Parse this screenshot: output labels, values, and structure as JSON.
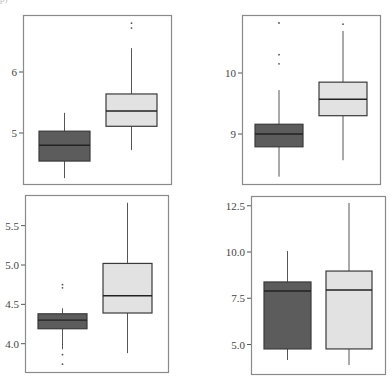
{
  "corner_label": "p) ",
  "colors": {
    "dark_fill": "#5c5c5c",
    "light_fill": "#e2e2e2",
    "box_stroke": "#3a3a3a",
    "median": "#222222",
    "frame": "#8a8a8a",
    "whisker": "#555555"
  },
  "chart_data": [
    {
      "type": "box",
      "panel": "top-left",
      "title": "",
      "xlabel": "",
      "ylabel": "",
      "yticks": [
        5,
        6
      ],
      "ytick_labels": [
        "5",
        "6"
      ],
      "ylim": [
        4.2,
        6.9
      ],
      "series": [
        {
          "name": "group 1 (dark)",
          "q1": 4.54,
          "median": 4.8,
          "q3": 5.03,
          "whisker_low": 4.26,
          "whisker_high": 5.33,
          "outliers": []
        },
        {
          "name": "group 2 (light)",
          "q1": 5.11,
          "median": 5.36,
          "q3": 5.64,
          "whisker_low": 4.72,
          "whisker_high": 6.39,
          "outliers": [
            6.72,
            6.8
          ]
        }
      ],
      "frame": {
        "x": 23,
        "y": 15,
        "w": 148,
        "h": 169
      },
      "px": {
        "ref_y": 133,
        "ref_v": 5,
        "px_per_unit": 61
      },
      "boxes_x": [
        [
          39,
          90
        ],
        [
          106,
          157
        ]
      ]
    },
    {
      "type": "box",
      "panel": "top-right",
      "title": "",
      "xlabel": "",
      "ylabel": "",
      "yticks": [
        9,
        10
      ],
      "ytick_labels": [
        "9",
        "10"
      ],
      "ylim": [
        8.2,
        10.9
      ],
      "series": [
        {
          "name": "group 1 (dark)",
          "q1": 8.79,
          "median": 9.0,
          "q3": 9.16,
          "whisker_low": 8.3,
          "whisker_high": 9.72,
          "outliers": [
            10.15,
            10.3,
            10.82
          ]
        },
        {
          "name": "group 2 (light)",
          "q1": 9.3,
          "median": 9.57,
          "q3": 9.85,
          "whisker_low": 8.57,
          "whisker_high": 10.69,
          "outliers": [
            10.8
          ]
        }
      ],
      "frame": {
        "x": 242,
        "y": 15,
        "w": 138,
        "h": 169
      },
      "px": {
        "ref_y": 134,
        "ref_v": 9,
        "px_per_unit": 61
      },
      "boxes_x": [
        [
          255,
          303
        ],
        [
          319,
          367
        ]
      ]
    },
    {
      "type": "box",
      "panel": "bottom-left",
      "title": "",
      "xlabel": "",
      "ylabel": "",
      "yticks": [
        4.0,
        4.5,
        5.0,
        5.5
      ],
      "ytick_labels": [
        "4.0",
        "4.5",
        "5.0",
        "5.5"
      ],
      "ylim": [
        3.65,
        5.9
      ],
      "series": [
        {
          "name": "group 1 (dark)",
          "q1": 4.19,
          "median": 4.3,
          "q3": 4.38,
          "whisker_low": 3.93,
          "whisker_high": 4.45,
          "outliers": [
            3.74,
            3.86,
            4.71,
            4.75
          ]
        },
        {
          "name": "group 2 (light)",
          "q1": 4.39,
          "median": 4.61,
          "q3": 5.02,
          "whisker_low": 3.88,
          "whisker_high": 5.79,
          "outliers": []
        }
      ],
      "frame": {
        "x": 25,
        "y": 195,
        "w": 143,
        "h": 177
      },
      "px": {
        "ref_y": 265,
        "ref_v": 5.0,
        "px_per_unit": 78.7
      },
      "boxes_x": [
        [
          38,
          87
        ],
        [
          103,
          152
        ]
      ]
    },
    {
      "type": "box",
      "panel": "bottom-right",
      "title": "",
      "xlabel": "",
      "ylabel": "",
      "yticks": [
        5.0,
        7.5,
        10.0,
        12.5
      ],
      "ytick_labels": [
        "5.0",
        "7.5",
        "10.0",
        "12.5"
      ],
      "ylim": [
        3.5,
        13.0
      ],
      "series": [
        {
          "name": "group 1 (dark)",
          "q1": 4.76,
          "median": 7.89,
          "q3": 8.38,
          "whisker_low": 4.16,
          "whisker_high": 10.05,
          "outliers": []
        },
        {
          "name": "group 2 (light)",
          "q1": 4.76,
          "median": 7.95,
          "q3": 8.97,
          "whisker_low": 3.89,
          "whisker_high": 12.65,
          "outliers": []
        }
      ],
      "frame": {
        "x": 251,
        "y": 196,
        "w": 134,
        "h": 178
      },
      "px": {
        "ref_y": 252,
        "ref_v": 10.0,
        "px_per_unit": 18.5
      },
      "boxes_x": [
        [
          264,
          311
        ],
        [
          326,
          372
        ]
      ]
    }
  ]
}
